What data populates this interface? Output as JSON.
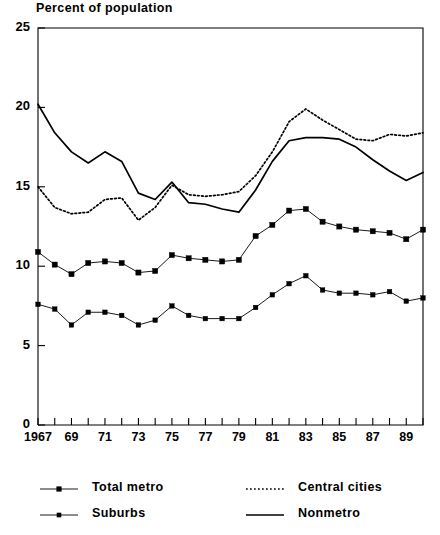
{
  "chart_data": {
    "type": "line",
    "title": "Percent of population",
    "xlabel": "",
    "ylabel": "Percent of population",
    "xlim": [
      1967,
      1990
    ],
    "ylim": [
      0,
      25
    ],
    "yticks": [
      0,
      5,
      10,
      15,
      20,
      25
    ],
    "ytick_labels": [
      "0",
      "5",
      "10",
      "15",
      "20",
      "25"
    ],
    "x": [
      1967,
      1968,
      1969,
      1970,
      1971,
      1972,
      1973,
      1974,
      1975,
      1976,
      1977,
      1978,
      1979,
      1980,
      1981,
      1982,
      1983,
      1984,
      1985,
      1986,
      1987,
      1988,
      1989,
      1990
    ],
    "xtick_labels": [
      "1967",
      "",
      "69",
      "",
      "71",
      "",
      "73",
      "",
      "75",
      "",
      "77",
      "",
      "79",
      "",
      "81",
      "",
      "83",
      "",
      "85",
      "",
      "87",
      "",
      "89",
      ""
    ],
    "grid": false,
    "legend_position": "below",
    "series": [
      {
        "name": "Total metro",
        "style": "solid-marker",
        "color": "#000000",
        "values": [
          10.9,
          10.1,
          9.5,
          10.2,
          10.3,
          10.2,
          9.6,
          9.7,
          10.7,
          10.5,
          10.4,
          10.3,
          10.4,
          11.9,
          12.6,
          13.5,
          13.6,
          12.8,
          12.5,
          12.3,
          12.2,
          12.1,
          11.7,
          12.3
        ]
      },
      {
        "name": "Suburbs",
        "style": "solid-smallmarker",
        "color": "#000000",
        "values": [
          7.6,
          7.3,
          6.3,
          7.1,
          7.1,
          6.9,
          6.3,
          6.6,
          7.5,
          6.9,
          6.7,
          6.7,
          6.7,
          7.4,
          8.2,
          8.9,
          9.4,
          8.5,
          8.3,
          8.3,
          8.2,
          8.4,
          7.8,
          8.0
        ]
      },
      {
        "name": "Central cities",
        "style": "dotted",
        "color": "#000000",
        "values": [
          15.0,
          13.7,
          13.3,
          13.4,
          14.2,
          14.3,
          12.9,
          13.7,
          15.1,
          14.5,
          14.4,
          14.5,
          14.7,
          15.7,
          17.2,
          19.1,
          19.9,
          19.2,
          18.6,
          18.0,
          17.9,
          18.3,
          18.2,
          18.4
        ]
      },
      {
        "name": "Nonmetro",
        "style": "solid",
        "color": "#000000",
        "values": [
          20.2,
          18.4,
          17.2,
          16.5,
          17.2,
          16.6,
          14.6,
          14.2,
          15.3,
          14.0,
          13.9,
          13.6,
          13.4,
          14.8,
          16.6,
          17.9,
          18.1,
          18.1,
          18.0,
          17.5,
          16.7,
          16.0,
          15.4,
          15.9
        ]
      }
    ]
  },
  "legend": {
    "entries": [
      {
        "label": "Total metro",
        "style": "solid-marker"
      },
      {
        "label": "Suburbs",
        "style": "solid-smallmarker"
      },
      {
        "label": "Central cities",
        "style": "dotted"
      },
      {
        "label": "Nonmetro",
        "style": "solid"
      }
    ]
  }
}
